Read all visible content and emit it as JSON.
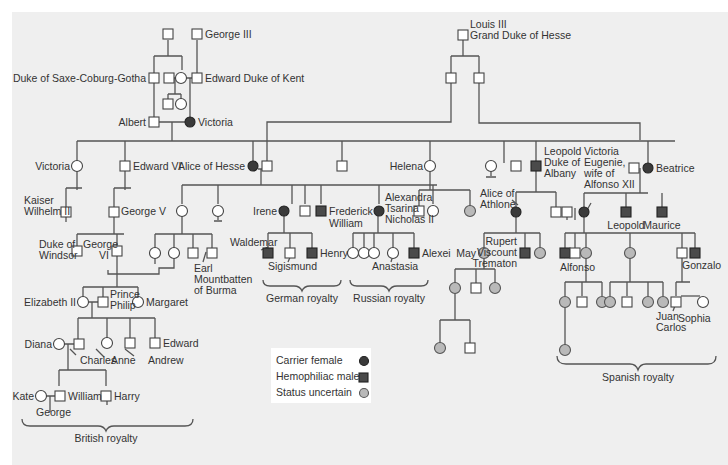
{
  "people": {
    "george_iii": "George III",
    "duke_saxe": "Duke of Saxe-Coburg-Gotha",
    "edward_kent": "Edward Duke of Kent",
    "albert": "Albert",
    "victoria": "Victoria",
    "louis_iii_1": "Louis III",
    "louis_iii_2": "Grand Duke of Hesse",
    "victoria_jr": "Victoria",
    "edward_vi": "Edward VI",
    "alice_hesse": "Alice of Hesse",
    "helena": "Helena",
    "leopold_1": "Leopold",
    "leopold_2": "Duke of",
    "leopold_3": "Albany",
    "beatrice": "Beatrice",
    "kaiser_1": "Kaiser",
    "kaiser_2": "Wilhelm II",
    "george_v": "George V",
    "irene": "Irene",
    "frederick_1": "Frederick",
    "frederick_2": "William",
    "alexandra_1": "Alexandra",
    "alexandra_2": "Tsarina",
    "alexandra_3": "Nicholas II",
    "alice_athlone_1": "Alice of",
    "alice_athlone_2": "Athlone",
    "vic_eug_1": "Victoria",
    "vic_eug_2": "Eugenie,",
    "vic_eug_3": "wife of",
    "vic_eug_4": "Alfonso XII",
    "leopold_jr": "Leopold",
    "maurice": "Maurice",
    "duke_windsor_1": "Duke of",
    "duke_windsor_2": "Windsor",
    "george_vi_1": "George",
    "george_vi_2": "VI",
    "earl_1": "Earl",
    "earl_2": "Mountbatten",
    "earl_3": "of  Burma",
    "waldemar": "Waldemar",
    "sigismund": "Sigismund",
    "henry": "Henry",
    "anastasia": "Anastasia",
    "alexei": "Alexei",
    "may": "May",
    "rupert_1": "Rupert",
    "rupert_2": "Viscount",
    "rupert_3": "Trematon",
    "alfonso": "Alfonso",
    "gonzalo": "Gonzalo",
    "elizabeth_ii": "Elizabeth II",
    "philip_1": "Prince",
    "philip_2": "Philip",
    "margaret": "Margaret",
    "diana": "Diana",
    "charles": "Charles",
    "anne": "Anne",
    "andrew": "Andrew",
    "edward": "Edward",
    "juan_1": "Juan",
    "juan_2": "Carlos",
    "sophia": "Sophia",
    "kate": "Kate",
    "william": "William",
    "harry": "Harry",
    "george": "George"
  },
  "groups": {
    "german": "German royalty",
    "russian": "Russian royalty",
    "british": "British royalty",
    "spanish": "Spanish royalty"
  },
  "legend": {
    "carrier": "Carrier female",
    "hemophiliac": "Hemophiliac male",
    "uncertain": "Status uncertain"
  },
  "colors": {
    "background": "#efefef",
    "carrier": "#3a3a3a",
    "hemophiliac": "#4a4a4a",
    "uncertain": "#b9b9b9",
    "line": "#555555"
  }
}
